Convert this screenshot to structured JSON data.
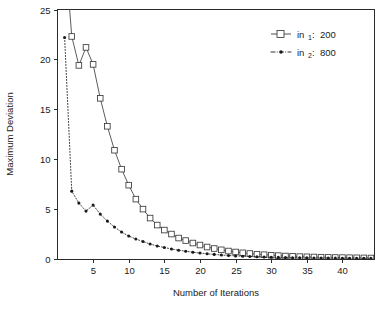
{
  "chart_data": {
    "type": "line",
    "title": "",
    "xlabel": "Number of Iterations",
    "ylabel": "Maximum Deviation",
    "xlim": [
      0,
      44.5
    ],
    "ylim": [
      0,
      25
    ],
    "xticks": [
      5,
      10,
      15,
      20,
      25,
      30,
      35,
      40
    ],
    "yticks": [
      0,
      5,
      10,
      15,
      20,
      25
    ],
    "xticklabels": [
      "5",
      "10",
      "15",
      "20",
      "25",
      "30",
      "35",
      "40"
    ],
    "yticklabels": [
      "0",
      "5",
      "10",
      "15",
      "20",
      "25"
    ],
    "grid": false,
    "legend_position": "top-right",
    "frame": "box",
    "series": [
      {
        "name": "in_1: 200",
        "legend_base": "in",
        "legend_sub": "1",
        "legend_value": "200",
        "marker": "open-square",
        "linestyle": "solid",
        "color": "#3a3a3a",
        "x": [
          1,
          2,
          3,
          4,
          5,
          6,
          7,
          8,
          9,
          10,
          11,
          12,
          13,
          14,
          15,
          16,
          17,
          18,
          19,
          20,
          21,
          22,
          23,
          24,
          25,
          26,
          27,
          28,
          29,
          30,
          31,
          32,
          33,
          34,
          35,
          36,
          37,
          38,
          39,
          40,
          41,
          42,
          43,
          44
        ],
        "values": [
          31.5,
          22.3,
          19.4,
          21.2,
          19.5,
          16.1,
          13.3,
          10.9,
          9.0,
          7.4,
          6.0,
          5.0,
          4.1,
          3.4,
          2.9,
          2.5,
          2.1,
          1.85,
          1.6,
          1.4,
          1.2,
          1.05,
          0.92,
          0.8,
          0.7,
          0.62,
          0.55,
          0.48,
          0.43,
          0.38,
          0.34,
          0.3,
          0.27,
          0.24,
          0.22,
          0.2,
          0.18,
          0.16,
          0.15,
          0.14,
          0.13,
          0.12,
          0.11,
          0.1
        ]
      },
      {
        "name": "in_2: 800",
        "legend_base": "in",
        "legend_sub": "2",
        "legend_value": "800",
        "marker": "filled-dot",
        "linestyle": "dotted",
        "color": "#1a1a1a",
        "x": [
          1,
          2,
          3,
          4,
          5,
          6,
          7,
          8,
          9,
          10,
          11,
          12,
          13,
          14,
          15,
          16,
          17,
          18,
          19,
          20,
          21,
          22,
          23,
          24,
          25,
          26,
          27,
          28,
          29,
          30,
          31,
          32,
          33,
          34,
          35,
          36,
          37,
          38,
          39,
          40,
          41,
          42,
          43,
          44
        ],
        "values": [
          22.2,
          6.8,
          5.6,
          4.8,
          5.4,
          4.5,
          3.8,
          3.2,
          2.7,
          2.3,
          2.0,
          1.75,
          1.5,
          1.3,
          1.15,
          1.0,
          0.88,
          0.78,
          0.68,
          0.6,
          0.52,
          0.46,
          0.4,
          0.35,
          0.31,
          0.28,
          0.25,
          0.22,
          0.2,
          0.18,
          0.16,
          0.15,
          0.13,
          0.12,
          0.11,
          0.1,
          0.095,
          0.09,
          0.085,
          0.08,
          0.075,
          0.07,
          0.065,
          0.06
        ]
      }
    ]
  },
  "axes": {
    "x_title": "Number of Iterations",
    "y_title": "Maximum Deviation"
  },
  "legend": {
    "entries": [
      {
        "base": "in",
        "sub": "1",
        "separator": ": ",
        "value": "200"
      },
      {
        "base": "in",
        "sub": "2",
        "separator": ": ",
        "value": "800"
      }
    ]
  },
  "colors": {
    "axis": "#2b2b2b",
    "series1": "#3a3a3a",
    "series2": "#1a1a1a",
    "background": "#ffffff"
  }
}
